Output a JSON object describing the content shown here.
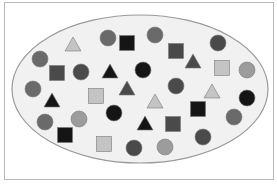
{
  "figure": {
    "colors": {
      "ellipse_fill": "#f1f1f1",
      "ellipse_stroke": "#9a9a9a",
      "black": "#151515",
      "dark": "#4a4a4a",
      "mid": "#6a6a6a",
      "light_mid": "#9c9c9c",
      "light": "#c4c4c4"
    },
    "ellipse": {
      "cx": 140,
      "cy": 89,
      "rx": 128,
      "ry": 74
    },
    "shapes": [
      {
        "type": "triangle",
        "x": 73,
        "y": 45,
        "tone": "light"
      },
      {
        "type": "circle",
        "x": 108,
        "y": 38,
        "tone": "mid"
      },
      {
        "type": "square",
        "x": 127,
        "y": 43,
        "tone": "black"
      },
      {
        "type": "circle",
        "x": 155,
        "y": 35,
        "tone": "mid"
      },
      {
        "type": "square",
        "x": 176,
        "y": 51,
        "tone": "dark"
      },
      {
        "type": "circle",
        "x": 218,
        "y": 43,
        "tone": "dark"
      },
      {
        "type": "circle",
        "x": 40,
        "y": 59,
        "tone": "mid"
      },
      {
        "type": "square",
        "x": 57,
        "y": 73,
        "tone": "dark"
      },
      {
        "type": "circle",
        "x": 81,
        "y": 72,
        "tone": "dark"
      },
      {
        "type": "triangle",
        "x": 110,
        "y": 72,
        "tone": "black"
      },
      {
        "type": "circle",
        "x": 143,
        "y": 70,
        "tone": "black"
      },
      {
        "type": "triangle",
        "x": 193,
        "y": 62,
        "tone": "dark"
      },
      {
        "type": "square",
        "x": 222,
        "y": 68,
        "tone": "light"
      },
      {
        "type": "circle",
        "x": 247,
        "y": 70,
        "tone": "light_mid"
      },
      {
        "type": "circle",
        "x": 33,
        "y": 89,
        "tone": "mid"
      },
      {
        "type": "triangle",
        "x": 52,
        "y": 101,
        "tone": "black"
      },
      {
        "type": "square",
        "x": 96,
        "y": 96,
        "tone": "light"
      },
      {
        "type": "triangle",
        "x": 127,
        "y": 89,
        "tone": "dark"
      },
      {
        "type": "circle",
        "x": 176,
        "y": 86,
        "tone": "dark"
      },
      {
        "type": "circle",
        "x": 247,
        "y": 98,
        "tone": "black"
      },
      {
        "type": "circle",
        "x": 45,
        "y": 122,
        "tone": "mid"
      },
      {
        "type": "circle",
        "x": 79,
        "y": 119,
        "tone": "light_mid"
      },
      {
        "type": "circle",
        "x": 114,
        "y": 113,
        "tone": "black"
      },
      {
        "type": "triangle",
        "x": 155,
        "y": 102,
        "tone": "light"
      },
      {
        "type": "triangle",
        "x": 212,
        "y": 92,
        "tone": "light"
      },
      {
        "type": "square",
        "x": 198,
        "y": 109,
        "tone": "black"
      },
      {
        "type": "triangle",
        "x": 145,
        "y": 124,
        "tone": "black"
      },
      {
        "type": "square",
        "x": 173,
        "y": 124,
        "tone": "dark"
      },
      {
        "type": "circle",
        "x": 234,
        "y": 117,
        "tone": "mid"
      },
      {
        "type": "square",
        "x": 65,
        "y": 135,
        "tone": "black"
      },
      {
        "type": "square",
        "x": 104,
        "y": 144,
        "tone": "light"
      },
      {
        "type": "circle",
        "x": 134,
        "y": 148,
        "tone": "dark"
      },
      {
        "type": "circle",
        "x": 165,
        "y": 147,
        "tone": "light_mid"
      },
      {
        "type": "circle",
        "x": 203,
        "y": 137,
        "tone": "dark"
      }
    ]
  }
}
